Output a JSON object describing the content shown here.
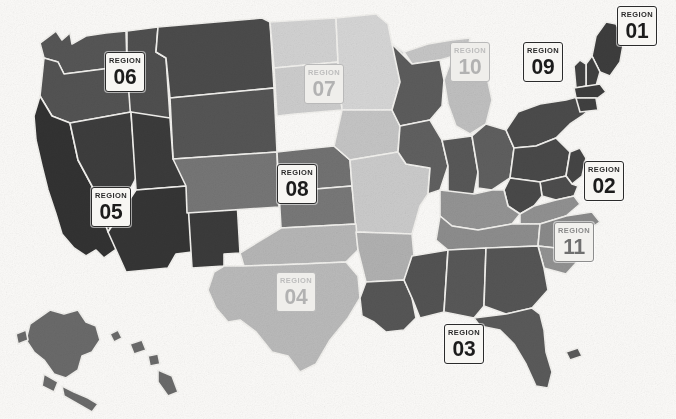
{
  "map": {
    "title": "United States Regions Map",
    "background_color": "#fbfaf8",
    "border_color": "#f4f3f0",
    "badge_word": "REGION",
    "palette": {
      "very_dark": "#3b3b3b",
      "dark": "#4d4d4d",
      "mid_dark": "#6d6d6d",
      "mid": "#8c8c8c",
      "mid_light": "#a5a5a5",
      "light": "#bdbdbd",
      "very_light": "#d4d4d4",
      "pale": "#e3e3e3"
    }
  },
  "regions": [
    {
      "id": "01",
      "label": "REGION",
      "number": "01",
      "name": "Northeast / New England",
      "tone": "strong",
      "fill": "#3f3f3f",
      "badge": {
        "x": 617,
        "y": 6
      },
      "states": [
        "ME",
        "NH",
        "VT",
        "MA",
        "RI",
        "CT"
      ]
    },
    {
      "id": "02",
      "label": "REGION",
      "number": "02",
      "name": "Mid-Atlantic",
      "tone": "strong",
      "fill": "#4a4a4a",
      "badge": {
        "x": 584,
        "y": 161
      },
      "states": [
        "NY",
        "NJ",
        "PA",
        "DE",
        "MD",
        "DC"
      ]
    },
    {
      "id": "03",
      "label": "REGION",
      "number": "03",
      "name": "Deep South",
      "tone": "strong",
      "fill": "#565656",
      "badge": {
        "x": 444,
        "y": 324
      },
      "states": [
        "LA",
        "MS",
        "AL",
        "GA",
        "FL"
      ]
    },
    {
      "id": "04",
      "label": "REGION",
      "number": "04",
      "name": "South Central",
      "tone": "faint",
      "fill": "#b4b4b4",
      "badge": {
        "x": 276,
        "y": 272
      },
      "states": [
        "TX",
        "OK",
        "AR"
      ]
    },
    {
      "id": "05",
      "label": "REGION",
      "number": "05",
      "name": "Southwest / Pacific",
      "tone": "strong",
      "fill": "#3c3c3c",
      "badge": {
        "x": 91,
        "y": 187
      },
      "states": [
        "CA",
        "NV",
        "AZ",
        "UT",
        "NM"
      ]
    },
    {
      "id": "06",
      "label": "REGION",
      "number": "06",
      "name": "Northwest",
      "tone": "strong",
      "fill": "#555555",
      "badge": {
        "x": 105,
        "y": 52
      },
      "states": [
        "WA",
        "OR",
        "ID",
        "MT",
        "WY"
      ]
    },
    {
      "id": "07",
      "label": "REGION",
      "number": "07",
      "name": "Upper Plains",
      "tone": "faint",
      "fill": "#cfcfcf",
      "badge": {
        "x": 304,
        "y": 64
      },
      "states": [
        "ND",
        "SD",
        "MN"
      ]
    },
    {
      "id": "08",
      "label": "REGION",
      "number": "08",
      "name": "Central Plains",
      "tone": "strong",
      "fill": "#747474",
      "badge": {
        "x": 277,
        "y": 164
      },
      "states": [
        "NE",
        "KS",
        "CO"
      ]
    },
    {
      "id": "09",
      "label": "REGION",
      "number": "09",
      "name": "Great Lakes East",
      "tone": "strong",
      "fill": "#5d5d5d",
      "badge": {
        "x": 523,
        "y": 42
      },
      "states": [
        "WI",
        "IL",
        "IN",
        "OH"
      ]
    },
    {
      "id": "10",
      "label": "REGION",
      "number": "10",
      "name": "Upper Midwest",
      "tone": "faint",
      "fill": "#c8c8c8",
      "badge": {
        "x": 450,
        "y": 42
      },
      "states": [
        "MI",
        "IA",
        "MO"
      ]
    },
    {
      "id": "11",
      "label": "REGION",
      "number": "11",
      "name": "Upper South / Appalachia",
      "tone": "mid",
      "fill": "#909090",
      "badge": {
        "x": 554,
        "y": 222
      },
      "states": [
        "KY",
        "TN",
        "VA",
        "WV",
        "NC",
        "SC"
      ]
    }
  ],
  "insets": [
    {
      "name": "alaska",
      "fill": "#6a6a6a"
    },
    {
      "name": "hawaii",
      "fill": "#6a6a6a"
    }
  ]
}
